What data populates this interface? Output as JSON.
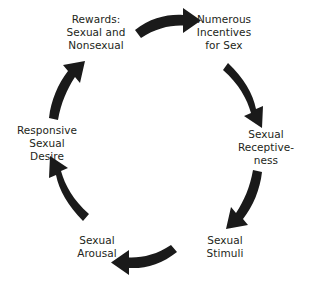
{
  "diagram": {
    "type": "circular-cycle",
    "direction": "clockwise",
    "background_color": "#ffffff",
    "text_color": "#231f20",
    "arrow_color": "#1a1a1a",
    "nodes": [
      {
        "id": "rewards",
        "position": "top-left",
        "lines": [
          "Rewards:",
          "Sexual and",
          "Nonsexual"
        ]
      },
      {
        "id": "incentives",
        "position": "top-right",
        "lines": [
          "Numerous",
          "Incentives",
          "for Sex"
        ]
      },
      {
        "id": "receptiveness",
        "position": "right",
        "lines": [
          "Sexual",
          "Receptive-",
          "ness"
        ]
      },
      {
        "id": "stimuli",
        "position": "bottom-right",
        "lines": [
          "Sexual",
          "Stimuli"
        ]
      },
      {
        "id": "arousal",
        "position": "bottom-left",
        "lines": [
          "Sexual",
          "Arousal"
        ]
      },
      {
        "id": "desire",
        "position": "left",
        "lines": [
          "Responsive",
          "Sexual",
          "Desire"
        ]
      }
    ],
    "labels": {
      "rewards": "Rewards:\nSexual and\nNonsexual",
      "incentives": "Numerous\nIncentives\nfor Sex",
      "receptiveness": "Sexual\nReceptive-\nness",
      "stimuli": "Sexual\nStimuli",
      "arousal": "Sexual\nArousal",
      "desire": "Responsive\nSexual\nDesire"
    },
    "arrows": [
      {
        "id": "arrow-rewards-to-incentives",
        "from": "rewards",
        "to": "incentives",
        "location": "top"
      },
      {
        "id": "arrow-incentives-to-receptiveness",
        "from": "incentives",
        "to": "receptiveness",
        "location": "upper-right"
      },
      {
        "id": "arrow-receptiveness-to-stimuli",
        "from": "receptiveness",
        "to": "stimuli",
        "location": "lower-right"
      },
      {
        "id": "arrow-stimuli-to-arousal",
        "from": "stimuli",
        "to": "arousal",
        "location": "bottom"
      },
      {
        "id": "arrow-arousal-to-desire",
        "from": "arousal",
        "to": "desire",
        "location": "lower-left"
      },
      {
        "id": "arrow-desire-to-rewards",
        "from": "desire",
        "to": "rewards",
        "location": "upper-left"
      }
    ]
  }
}
